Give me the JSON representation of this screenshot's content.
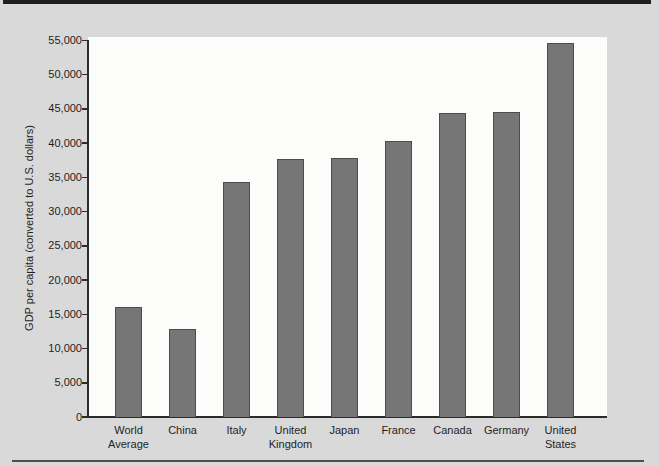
{
  "figure": {
    "background_color": "#d9d9da",
    "top_rule_color": "#1f1f1f",
    "bottom_rule_color": "#4f4f4f"
  },
  "chart_data": {
    "type": "bar",
    "title": "",
    "xlabel": "",
    "ylabel": "GDP per capita (converted to U.S. dollars)",
    "categories": [
      "World Average",
      "China",
      "Italy",
      "United Kingdom",
      "Japan",
      "France",
      "Canada",
      "Germany",
      "United States"
    ],
    "values": [
      16100,
      12900,
      34400,
      37700,
      37800,
      40300,
      44400,
      44600,
      54700
    ],
    "ylim": [
      0,
      55000
    ],
    "ytick_step": 5000,
    "ytick_labels": [
      "0",
      "5,000",
      "10,000",
      "15,000",
      "20,000",
      "25,000",
      "30,000",
      "35,000",
      "40,000",
      "45,000",
      "50,000",
      "55,000"
    ],
    "grid": false,
    "legend": "none",
    "bar_color": "#767676",
    "bar_border_color": "#4d4d4d",
    "plot_background": "#fcfcfa",
    "axis_color": "#2b2b2b",
    "text_color": "#1f1f1f"
  }
}
